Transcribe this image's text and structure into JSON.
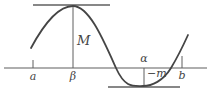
{
  "figure": {
    "background_color": "#ffffff",
    "line_color": "#5f5f5f",
    "curve_color": "#454545",
    "labels": {
      "left_endpoint": "a",
      "max_abscissa": "β",
      "max_value": "M",
      "min_abscissa": "α",
      "min_value": "−m",
      "right_endpoint": "b"
    }
  }
}
